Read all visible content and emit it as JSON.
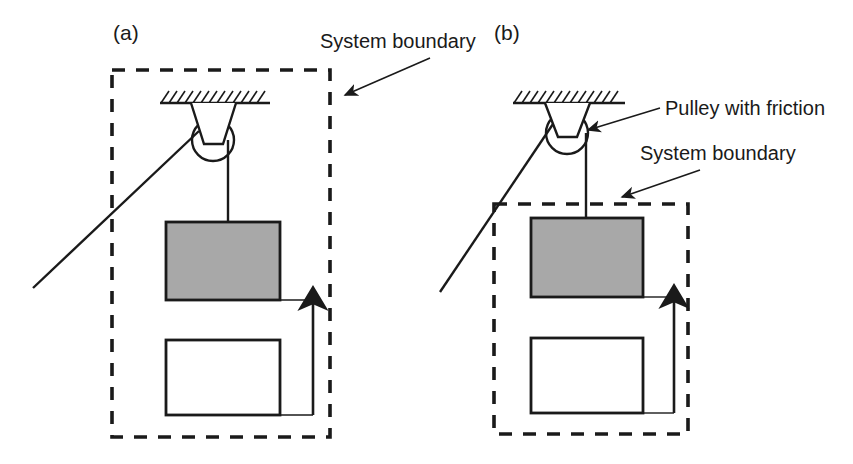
{
  "figure": {
    "background_color": "#ffffff",
    "line_color": "#1a1a1a",
    "block_fill_gray": "#a8a8a8",
    "block_fill_white": "#ffffff",
    "panels": [
      {
        "id": "a",
        "panel_label": "(a)",
        "panel_label_pos": {
          "x": 113,
          "y": 40
        },
        "boundary_label": "System boundary",
        "boundary_label_pos": {
          "x": 320,
          "y": 48
        },
        "boundary_rect": {
          "x": 112,
          "y": 70,
          "width": 218,
          "height": 367
        },
        "boundary_note": "dashed boundary encloses pulley, ceiling support and both blocks",
        "leader": {
          "x1": 430,
          "y1": 58,
          "x2": 343,
          "y2": 96
        },
        "ceiling": {
          "x1": 160,
          "y1": 103,
          "x2": 270,
          "y2": 103,
          "hatch_count": 13
        },
        "pulley": {
          "cx": 213,
          "cy": 140,
          "r": 21
        },
        "bracket": {
          "top_left": 191,
          "top_right": 236,
          "bottom_left": 204,
          "bottom_right": 223,
          "top_y": 103,
          "bottom_y": 144
        },
        "rope_diagonal": {
          "x1": 33,
          "y1": 288,
          "x2": 199,
          "y2": 131
        },
        "rope_vertical": {
          "x1": 228,
          "y1": 140,
          "x2": 228,
          "y2": 222
        },
        "gray_block": {
          "x": 166,
          "y": 222,
          "width": 114,
          "height": 78,
          "fill": "#a8a8a8"
        },
        "white_block": {
          "x": 166,
          "y": 340,
          "width": 114,
          "height": 75,
          "fill": "#ffffff"
        },
        "gap_arrow": {
          "x": 313,
          "y_tip": 292,
          "y_base": 415,
          "lead_top_x": 280,
          "lead_bottom_x": 280
        }
      },
      {
        "id": "b",
        "panel_label": "(b)",
        "panel_label_pos": {
          "x": 494,
          "y": 40
        },
        "boundary_label": "System boundary",
        "boundary_label_pos": {
          "x": 640,
          "y": 160
        },
        "pulley_label": "Pulley with friction",
        "pulley_label_pos": {
          "x": 665,
          "y": 115
        },
        "boundary_rect": {
          "x": 494,
          "y": 204,
          "width": 194,
          "height": 230
        },
        "boundary_note": "dashed boundary encloses only the two blocks, excluding the pulley",
        "leader_boundary": {
          "x1": 700,
          "y1": 170,
          "x2": 620,
          "y2": 198
        },
        "leader_pulley": {
          "x1": 660,
          "y1": 108,
          "x2": 585,
          "y2": 131
        },
        "ceiling": {
          "x1": 513,
          "y1": 103,
          "x2": 625,
          "y2": 103,
          "hatch_count": 13
        },
        "pulley": {
          "cx": 567,
          "cy": 133,
          "r": 21
        },
        "bracket": {
          "top_left": 545,
          "top_right": 590,
          "bottom_left": 558,
          "bottom_right": 577,
          "top_y": 103,
          "bottom_y": 137
        },
        "rope_diagonal": {
          "x1": 440,
          "y1": 290,
          "x2": 553,
          "y2": 124
        },
        "rope_vertical": {
          "x1": 586,
          "y1": 133,
          "x2": 586,
          "y2": 218
        },
        "gray_block": {
          "x": 531,
          "y": 218,
          "width": 112,
          "height": 79,
          "fill": "#a8a8a8"
        },
        "white_block": {
          "x": 531,
          "y": 338,
          "width": 112,
          "height": 75,
          "fill": "#ffffff"
        },
        "gap_arrow": {
          "x": 674,
          "y_tip": 290,
          "y_base": 413,
          "lead_top_x": 643,
          "lead_bottom_x": 643
        }
      }
    ]
  }
}
